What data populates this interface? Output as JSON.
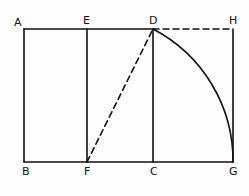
{
  "diagram": {
    "stroke_color": "#111111",
    "background": "#fdfdfd",
    "points": {
      "A": {
        "label": "A",
        "x": 24,
        "y": 29
      },
      "E": {
        "label": "E",
        "x": 87,
        "y": 29
      },
      "D": {
        "label": "D",
        "x": 153,
        "y": 29
      },
      "H": {
        "label": "H",
        "x": 233,
        "y": 29
      },
      "B": {
        "label": "B",
        "x": 24,
        "y": 162
      },
      "F": {
        "label": "F",
        "x": 87,
        "y": 162
      },
      "C": {
        "label": "C",
        "x": 153,
        "y": 162
      },
      "G": {
        "label": "G",
        "x": 233,
        "y": 162
      }
    },
    "solid_segments": [
      "A-D",
      "B-G",
      "A-B",
      "E-F",
      "D-C",
      "H-G"
    ],
    "dashed_segments": [
      "D-H",
      "F-D"
    ],
    "arcs": [
      {
        "from": "D",
        "to": "G",
        "center": "F"
      }
    ]
  }
}
